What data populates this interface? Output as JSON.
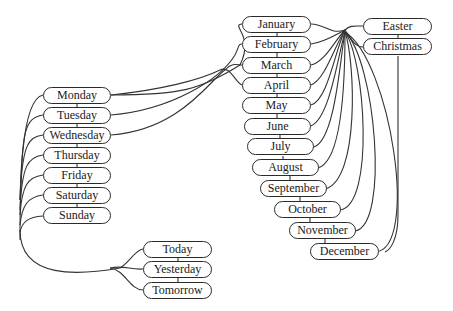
{
  "groups": {
    "days": [
      "Monday",
      "Tuesday",
      "Wednesday",
      "Thursday",
      "Friday",
      "Saturday",
      "Sunday"
    ],
    "relative_days": [
      "Today",
      "Yesterday",
      "Tomorrow"
    ],
    "months": [
      "January",
      "February",
      "March",
      "April",
      "May",
      "June",
      "July",
      "August",
      "September",
      "October",
      "November",
      "December"
    ],
    "holidays": [
      "Easter",
      "Christmas"
    ]
  },
  "nodes": {
    "monday": "Monday",
    "tuesday": "Tuesday",
    "wednesday": "Wednesday",
    "thursday": "Thursday",
    "friday": "Friday",
    "saturday": "Saturday",
    "sunday": "Sunday",
    "today": "Today",
    "yesterday": "Yesterday",
    "tomorrow": "Tomorrow",
    "january": "January",
    "february": "February",
    "march": "March",
    "april": "April",
    "may": "May",
    "june": "June",
    "july": "July",
    "august": "August",
    "september": "September",
    "october": "October",
    "november": "November",
    "december": "December",
    "easter": "Easter",
    "christmas": "Christmas"
  },
  "colors": {
    "stroke": "#2a2a2a",
    "background": "#ffffff",
    "text": "#1a1a1a"
  }
}
